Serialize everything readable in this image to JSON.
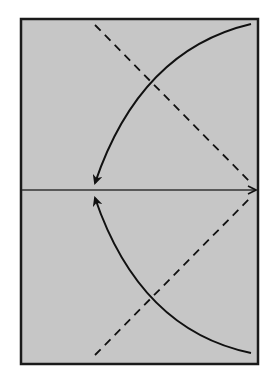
{
  "diagram": {
    "type": "ray-diagram",
    "colors": {
      "page_background": "#ffffff",
      "panel_background": "#c6c6c6",
      "frame": "#1a1a1a",
      "stroke": "#111111"
    },
    "frame": {
      "x": 21,
      "y": 19,
      "width": 237,
      "height": 345
    },
    "axis": {
      "x1": 22,
      "y1": 190,
      "x2": 256,
      "y2": 190,
      "arrow": "right"
    },
    "dashed_lines": [
      {
        "x1": 95,
        "y1": 25,
        "x2": 252,
        "y2": 184
      },
      {
        "x1": 95,
        "y1": 355,
        "x2": 252,
        "y2": 196
      }
    ],
    "curves": [
      {
        "from": [
          251,
          24
        ],
        "to": [
          95,
          183
        ],
        "control": [
          140,
          50
        ],
        "arrow": "end"
      },
      {
        "from": [
          251,
          353
        ],
        "to": [
          95,
          198
        ],
        "control": [
          140,
          330
        ],
        "arrow": "end"
      }
    ]
  }
}
